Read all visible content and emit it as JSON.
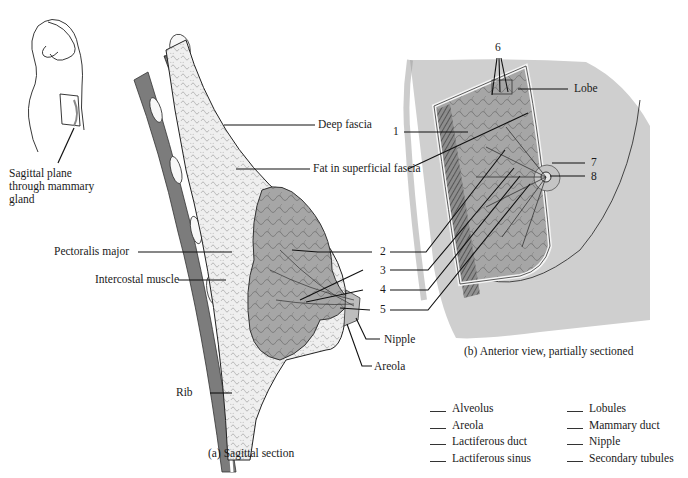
{
  "figure": {
    "inset": {
      "label": "Sagittal plane through mammary gland",
      "lines": [
        "Sagittal plane",
        "through mammary",
        "gland"
      ]
    },
    "sagittal_section": {
      "caption": "(a) Sagittal section",
      "labels": {
        "deep_fascia": "Deep fascia",
        "fat": "Fat in superficial fascia",
        "pectoralis": "Pectoralis major",
        "intercostal": "Intercostal muscle",
        "rib": "Rib",
        "nipple": "Nipple",
        "areola": "Areola"
      }
    },
    "anterior_view": {
      "caption": "(b) Anterior view, partially sectioned",
      "labels": {
        "lobe": "Lobe"
      }
    },
    "numbered_callouts": [
      "1",
      "2",
      "3",
      "4",
      "5",
      "6",
      "7",
      "8"
    ],
    "answer_key": {
      "left": [
        "Alveolus",
        "Areola",
        "Lactiferous duct",
        "Lactiferous sinus"
      ],
      "right": [
        "Lobules",
        "Mammary duct",
        "Nipple",
        "Secondary tubules"
      ]
    },
    "colors": {
      "skin_grey": "#cfcfcf",
      "tissue_grey": "#a9a9a9",
      "fat_light": "#ececec",
      "muscle_dark": "#5a5a5a",
      "line": "#1a1a1a"
    }
  }
}
